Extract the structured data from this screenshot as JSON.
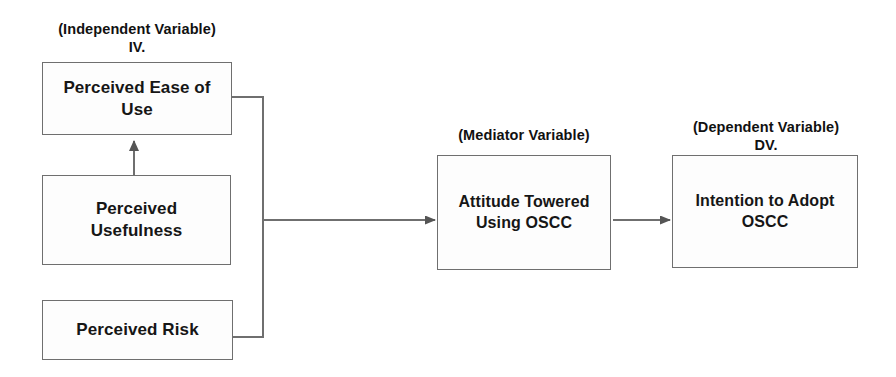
{
  "diagram": {
    "type": "flow-diagram",
    "background_color": "#ffffff",
    "line_color": "#6f6f6f",
    "text_color": "#161616",
    "captions": {
      "independent": "(Independent Variable)\nIV.",
      "mediator": "(Mediator Variable)",
      "dependent": "(Dependent Variable)\nDV."
    },
    "nodes": [
      {
        "id": "peou",
        "label": "Perceived Ease of Use",
        "group": "independent"
      },
      {
        "id": "pu",
        "label": "Perceived Usefulness",
        "group": "independent"
      },
      {
        "id": "pr",
        "label": "Perceived Risk",
        "group": "independent"
      },
      {
        "id": "att",
        "label": "Attitude Towered Using OSCC",
        "group": "mediator"
      },
      {
        "id": "int",
        "label": "Intention to Adopt OSCC",
        "group": "dependent"
      }
    ],
    "edges": [
      {
        "from": "pu",
        "to": "peou",
        "style": "arrow-up"
      },
      {
        "from": "peou",
        "to": "bus",
        "style": "elbow"
      },
      {
        "from": "pr",
        "to": "bus",
        "style": "elbow"
      },
      {
        "from": "bus",
        "to": "att",
        "style": "arrow-right"
      },
      {
        "from": "att",
        "to": "int",
        "style": "arrow-right"
      }
    ]
  }
}
